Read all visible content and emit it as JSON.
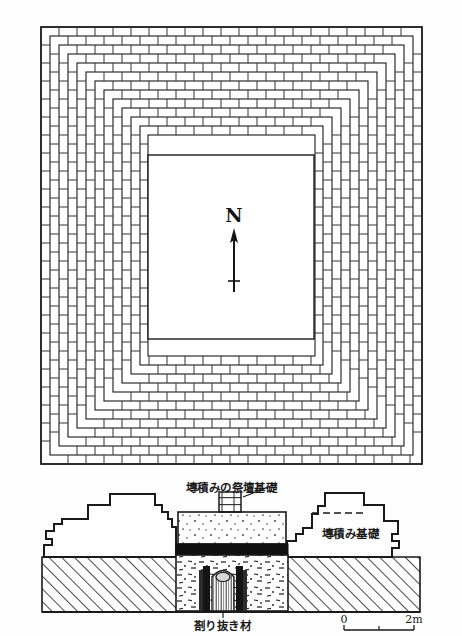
{
  "figure": {
    "type": "archaeological-plan-and-section",
    "background_color": "#fefefe",
    "ink_color": "#1a1a1a",
    "plan": {
      "name": "brick-foundation-plan",
      "bounds": {
        "x": 41,
        "y": 27,
        "width": 381,
        "height": 437
      },
      "inner_court": {
        "x": 148,
        "y": 155,
        "width": 166,
        "height": 184
      },
      "ring_count": 11,
      "north_arrow": {
        "label": "N",
        "x": 234,
        "label_y": 220,
        "arrow_top_y": 232,
        "arrow_bottom_y": 292,
        "crossbar_y": 281
      }
    },
    "section": {
      "name": "foundation-section",
      "ground_line_y": 557,
      "baseline_y": 612,
      "left_mass_label": "",
      "right_mass_label": "塼積み基礎",
      "altar_label": "塼積みの祭壇基礎",
      "timber_label": "剳り抜き材"
    },
    "labels": {
      "altar_foundation": "塼積みの祭壇基礎",
      "brick_foundation": "塼積み基礎",
      "hollowed_timber": "剳り抜き材",
      "north": "N"
    },
    "scale_bar": {
      "name": "scale-bar",
      "start_label": "0",
      "end_label": "2m",
      "mid_tick": true,
      "x_start": 344,
      "x_end": 414,
      "y": 630
    }
  }
}
